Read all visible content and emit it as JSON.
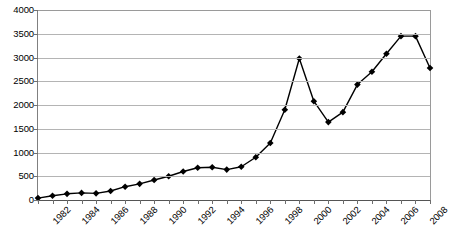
{
  "chart_data": {
    "type": "line",
    "title": "",
    "xlabel": "",
    "ylabel": "",
    "xlim": [
      1982,
      2009
    ],
    "ylim": [
      0,
      4000
    ],
    "ytick_step": 500,
    "grid": true,
    "legend": "none",
    "marker": "diamond",
    "line_color": "#000000",
    "marker_color": "#000000",
    "gridline_color": "#b4b4b4",
    "y_ticks": [
      0,
      500,
      1000,
      1500,
      2000,
      2500,
      3000,
      3500,
      4000
    ],
    "y_tick_labels": [
      "0",
      "500",
      "1000",
      "1500",
      "2000",
      "2500",
      "3000",
      "3500",
      "4000"
    ],
    "x_tick_labels": [
      "1982",
      "1984",
      "1986",
      "1988",
      "1990",
      "1992",
      "1994",
      "1996",
      "1998",
      "2000",
      "2002",
      "2004",
      "2006",
      "2008"
    ],
    "x": [
      1982,
      1983,
      1984,
      1985,
      1986,
      1987,
      1988,
      1989,
      1990,
      1991,
      1992,
      1993,
      1994,
      1995,
      1996,
      1997,
      1998,
      1999,
      2000,
      2001,
      2002,
      2003,
      2004,
      2005,
      2006,
      2007,
      2008,
      2009
    ],
    "values": [
      40,
      90,
      130,
      150,
      140,
      190,
      280,
      340,
      420,
      500,
      600,
      680,
      690,
      640,
      700,
      900,
      1200,
      1900,
      2980,
      2080,
      1640,
      1850,
      2430,
      2700,
      3080,
      3450,
      3450,
      2780
    ],
    "categories": [
      "1982",
      "1983",
      "1984",
      "1985",
      "1986",
      "1987",
      "1988",
      "1989",
      "1990",
      "1991",
      "1992",
      "1993",
      "1994",
      "1995",
      "1996",
      "1997",
      "1998",
      "1999",
      "2000",
      "2001",
      "2002",
      "2003",
      "2004",
      "2005",
      "2006",
      "2007",
      "2008",
      "2009"
    ],
    "series": [
      {
        "name": "series-1",
        "values": [
          40,
          90,
          130,
          150,
          140,
          190,
          280,
          340,
          420,
          500,
          600,
          680,
          690,
          640,
          700,
          900,
          1200,
          1900,
          2980,
          2080,
          1640,
          1850,
          2430,
          2700,
          3080,
          3450,
          3450,
          2780
        ]
      }
    ]
  }
}
